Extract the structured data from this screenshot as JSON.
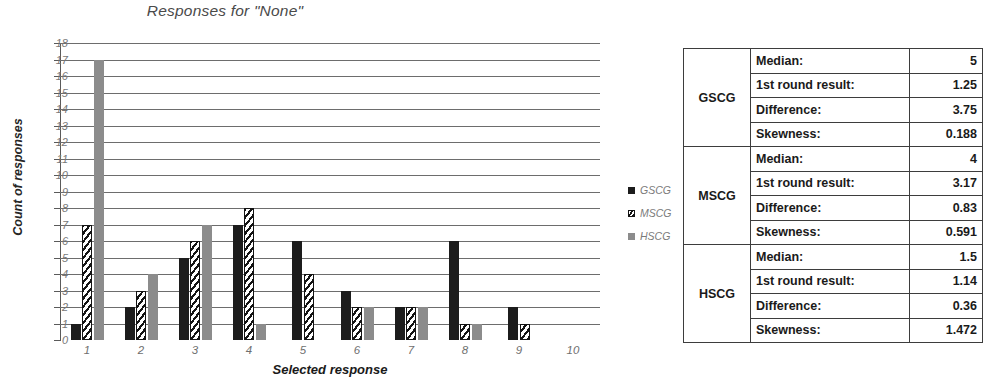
{
  "chart": {
    "title": "Responses for \"None\"",
    "x_axis_title": "Selected response",
    "y_axis_title": "Count of responses"
  },
  "legend": {
    "position": "right",
    "entries": [
      {
        "label": "GSCG",
        "color": "#1c1c1c",
        "pattern": "solid-black"
      },
      {
        "label": "MSCG",
        "color": "#141414",
        "pattern": "diagonal-hatch"
      },
      {
        "label": "HSCG",
        "color": "#8c8c8c",
        "pattern": "solid-gray"
      }
    ]
  },
  "chart_data": {
    "type": "bar",
    "title": "Responses for \"None\"",
    "xlabel": "Selected response",
    "ylabel": "Count of responses",
    "categories": [
      "1",
      "2",
      "3",
      "4",
      "5",
      "6",
      "7",
      "8",
      "9",
      "10"
    ],
    "series": [
      {
        "name": "GSCG",
        "color": "#1c1c1c",
        "values": [
          1,
          2,
          5,
          7,
          6,
          3,
          2,
          6,
          2,
          0
        ]
      },
      {
        "name": "MSCG",
        "color": "#141414",
        "values": [
          7,
          3,
          6,
          8,
          4,
          2,
          2,
          1,
          1,
          0
        ]
      },
      {
        "name": "HSCG",
        "color": "#8c8c8c",
        "values": [
          17,
          4,
          7,
          1,
          0,
          2,
          2,
          1,
          0,
          0
        ]
      }
    ],
    "ylim": [
      0,
      18
    ],
    "y_ticks": [
      0,
      1,
      2,
      3,
      4,
      5,
      6,
      7,
      8,
      9,
      10,
      11,
      12,
      13,
      14,
      15,
      16,
      17,
      18
    ],
    "grid": true,
    "legend_position": "right"
  },
  "stats_table": {
    "rows": [
      {
        "group": "GSCG",
        "label": "Median:",
        "value": "5"
      },
      {
        "group": "",
        "label": "1st round result:",
        "value": "1.25"
      },
      {
        "group": "",
        "label": "Difference:",
        "value": "3.75"
      },
      {
        "group": "",
        "label": "Skewness:",
        "value": "0.188"
      },
      {
        "group": "MSCG",
        "label": "Median:",
        "value": "4"
      },
      {
        "group": "",
        "label": "1st round result:",
        "value": "3.17"
      },
      {
        "group": "",
        "label": "Difference:",
        "value": "0.83"
      },
      {
        "group": "",
        "label": "Skewness:",
        "value": "0.591"
      },
      {
        "group": "HSCG",
        "label": "Median:",
        "value": "1.5"
      },
      {
        "group": "",
        "label": "1st round result:",
        "value": "1.14"
      },
      {
        "group": "",
        "label": "Difference:",
        "value": "0.36"
      },
      {
        "group": "",
        "label": "Skewness:",
        "value": "1.472"
      }
    ]
  }
}
